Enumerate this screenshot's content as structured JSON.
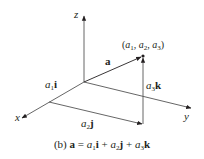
{
  "diagram": {
    "axes": {
      "x_label": "x",
      "y_label": "y",
      "z_label": "z"
    },
    "point_label": {
      "open": "(",
      "a1": "a",
      "a1_sub": "1",
      "sep1": ", ",
      "a2": "a",
      "a2_sub": "2",
      "sep2": ", ",
      "a3": "a",
      "a3_sub": "3",
      "close": ")"
    },
    "vector_label": "a",
    "components": {
      "i": {
        "coef": "a",
        "sub": "1",
        "unit": "i"
      },
      "j": {
        "coef": "a",
        "sub": "2",
        "unit": "j"
      },
      "k": {
        "coef": "a",
        "sub": "3",
        "unit": "k"
      }
    },
    "caption": {
      "prefix": "(b) ",
      "lhs": "a",
      "eq": " = ",
      "t1_coef": "a",
      "t1_sub": "1",
      "t1_unit": "i",
      "plus1": " + ",
      "t2_coef": "a",
      "t2_sub": "2",
      "t2_unit": "j",
      "plus2": " + ",
      "t3_coef": "a",
      "t3_sub": "3",
      "t3_unit": "k"
    },
    "colors": {
      "axis": "#555555",
      "vector": "#231f20",
      "text": "#231f20"
    }
  }
}
